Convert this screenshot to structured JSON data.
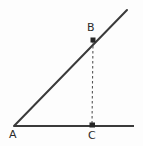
{
  "figure": {
    "kind": "geometry-diagram",
    "background_color": "#fdfdfd",
    "stroke_color": "#3a3a3a",
    "dash_color": "#555555",
    "label_color": "#2b2b2b",
    "width": 143,
    "height": 146,
    "points": [
      {
        "id": "A",
        "label": "A",
        "x": 14,
        "y": 126,
        "marker": "none",
        "label_x": 9,
        "label_y": 129
      },
      {
        "id": "B",
        "label": "B",
        "x": 93,
        "y": 40,
        "marker": "square",
        "label_x": 87,
        "label_y": 22
      },
      {
        "id": "C",
        "label": "C",
        "x": 92,
        "y": 126,
        "marker": "square",
        "label_x": 88,
        "label_y": 130
      }
    ],
    "segments": [
      {
        "id": "horizontal-ray",
        "from": "A",
        "to_x": 134,
        "to_y": 126,
        "style": "solid",
        "width": 2.2
      },
      {
        "id": "diagonal-ray",
        "from": "A",
        "to_x": 127,
        "to_y": 10,
        "style": "solid",
        "width": 2.0
      },
      {
        "id": "altitude-bc",
        "from": "B",
        "to_x": 92,
        "to_y": 126,
        "style": "dashed",
        "width": 1.1,
        "dash_pattern": "2.5,2.5"
      }
    ]
  }
}
